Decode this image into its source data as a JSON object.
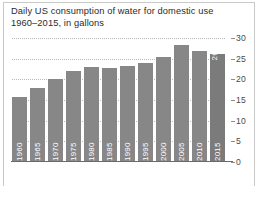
{
  "title": {
    "line1": "Daily US consumption of water for domestic use",
    "line2": "1960–2015, in gallons"
  },
  "chart_data": {
    "type": "bar",
    "title": "Daily US consumption of water for domestic use 1960–2015, in gallons",
    "subtitle": "1960–2015, in gallons",
    "xlabel": "",
    "ylabel": "",
    "categories": [
      "1960",
      "1965",
      "1970",
      "1975",
      "1980",
      "1985",
      "1990",
      "1995",
      "2000",
      "2005",
      "2010",
      "2015"
    ],
    "values": [
      15.8,
      17.8,
      20.0,
      22.0,
      23.0,
      22.7,
      23.2,
      24.0,
      25.5,
      28.2,
      26.8,
      26.1
    ],
    "ylim": [
      0,
      30
    ],
    "yticks": [
      0,
      5,
      10,
      15,
      20,
      25,
      30
    ],
    "ytick_labels": [
      "0",
      "5",
      "10",
      "15",
      "20",
      "25",
      "30"
    ],
    "grid": true,
    "grid_axis": "y",
    "legend": false,
    "bar_color": "#878787",
    "highlight_color": "#7b7b7b",
    "data_labels": [
      null,
      null,
      null,
      null,
      null,
      null,
      null,
      null,
      null,
      null,
      null,
      "26.1"
    ],
    "axis_position": "right"
  }
}
